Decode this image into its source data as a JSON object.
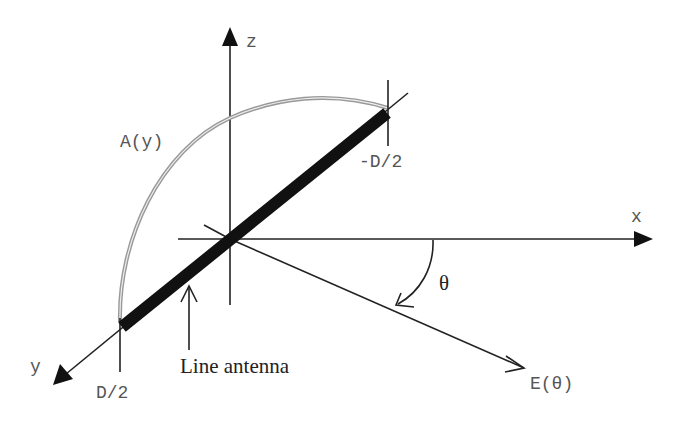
{
  "diagram": {
    "axes": {
      "z": "z",
      "x": "x",
      "y": "y"
    },
    "labels": {
      "aperture": "A(y)",
      "top_end": "-D/2",
      "bottom_end": "D/2",
      "antenna": "Line antenna",
      "angle": "θ",
      "field": "E(θ)"
    },
    "colors": {
      "axes": "#222222",
      "antenna": "#111111",
      "aperture_arc": "#999999",
      "text": "#555555"
    }
  }
}
